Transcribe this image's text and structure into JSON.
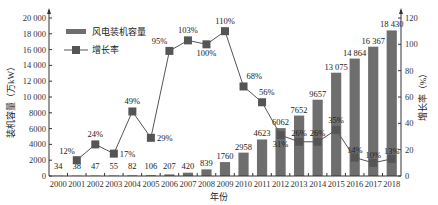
{
  "chart_data": {
    "type": "bar+line",
    "title": "",
    "xlabel": "年份",
    "ylabel_left": "装机容量（万kW）",
    "ylabel_right": "增长率（%）",
    "ylim_left": [
      0,
      20000
    ],
    "ylim_right": [
      0,
      120
    ],
    "yticks_left": [
      "0",
      "2000",
      "4000",
      "6000",
      "8000",
      "10 000",
      "12 000",
      "14 000",
      "16 000",
      "18 000",
      "20 000"
    ],
    "yticks_right": [
      "0",
      "20",
      "40",
      "60",
      "80",
      "100",
      "120"
    ],
    "grid": false,
    "legend_position": "upper-left",
    "categories": [
      "2000",
      "2001",
      "2002",
      "2003",
      "2004",
      "2005",
      "2006",
      "2007",
      "2008",
      "2009",
      "2010",
      "2011",
      "2012",
      "2013",
      "2014",
      "2015",
      "2016",
      "2017",
      "2018"
    ],
    "series": [
      {
        "name": "风电装机容量",
        "type": "bar",
        "axis": "left",
        "color": "#6e6e6e",
        "values": [
          34,
          38,
          47,
          55,
          82,
          106,
          207,
          420,
          839,
          1760,
          2958,
          4623,
          6062,
          7652,
          9657,
          13075,
          14864,
          16367,
          18430
        ],
        "labels": [
          "34",
          "38",
          "47",
          "55",
          "82",
          "106",
          "207",
          "420",
          "839",
          "1760",
          "2958",
          "4623",
          "6062",
          "7652",
          "9657",
          "13 075",
          "14 864",
          "16 367",
          "18 430"
        ]
      },
      {
        "name": "增长率",
        "type": "line",
        "axis": "right",
        "color": "#555555",
        "marker": "square",
        "values": [
          null,
          12,
          24,
          17,
          49,
          29,
          95,
          103,
          100,
          110,
          68,
          56,
          31,
          26,
          26,
          35,
          14,
          10,
          13
        ],
        "labels": [
          "",
          "12%",
          "24%",
          "17%",
          "49%",
          "29%",
          "95%",
          "103%",
          "100%",
          "110%",
          "68%",
          "56%",
          "31%",
          "26%",
          "26%",
          "35%",
          "14%",
          "10%",
          "13%"
        ]
      }
    ]
  },
  "legend": {
    "bar_label": "风电装机容量",
    "line_label": "增长率"
  },
  "axes": {
    "x_title": "年份",
    "left_title": "装机容量（万kW）",
    "right_title": "增长率（%）"
  }
}
